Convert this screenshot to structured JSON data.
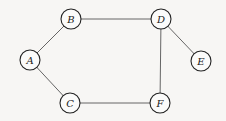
{
  "diagram": {
    "type": "undirected-graph",
    "nodes": [
      {
        "id": "A",
        "label": "A"
      },
      {
        "id": "B",
        "label": "B"
      },
      {
        "id": "C",
        "label": "C"
      },
      {
        "id": "D",
        "label": "D"
      },
      {
        "id": "E",
        "label": "E"
      },
      {
        "id": "F",
        "label": "F"
      }
    ],
    "edges": [
      {
        "from": "A",
        "to": "B"
      },
      {
        "from": "A",
        "to": "C"
      },
      {
        "from": "B",
        "to": "D"
      },
      {
        "from": "C",
        "to": "F"
      },
      {
        "from": "D",
        "to": "E"
      },
      {
        "from": "D",
        "to": "F"
      }
    ]
  }
}
